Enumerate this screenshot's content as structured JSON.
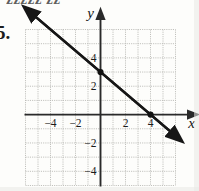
{
  "figure": {
    "problem_number": "5.",
    "top_cut_text": "zzzzz zz",
    "axis_label_x": "x",
    "axis_label_y": "y"
  },
  "chart_data": {
    "type": "line",
    "title": "",
    "xlabel": "x",
    "ylabel": "y",
    "grid": true,
    "legend": null,
    "xlim": [
      -6,
      6
    ],
    "ylim": [
      -5,
      6
    ],
    "x_ticks": [
      -4,
      -2,
      2,
      4
    ],
    "y_ticks": [
      -4,
      -2,
      2,
      4
    ],
    "x_tick_labels": [
      "−4",
      "−2",
      "2",
      "4"
    ],
    "y_tick_labels": [
      "−4",
      "−2",
      "2",
      "4"
    ],
    "grid_step": 1,
    "series": [
      {
        "name": "line",
        "equation": "y = -3/4 x + 3",
        "slope": -0.75,
        "intercept": 3,
        "x": [
          -5.3,
          5.7
        ],
        "y": [
          6.975,
          -1.275
        ],
        "arrow_start": true,
        "arrow_end": true
      }
    ],
    "points": [
      {
        "label": "y-intercept",
        "x": 0,
        "y": 3
      },
      {
        "label": "x-intercept",
        "x": 4,
        "y": 0
      }
    ],
    "colors": {
      "line": "#161616",
      "axis": "#2a2a2a",
      "grid": "#b9b9b4",
      "point": "#111111",
      "background": "#fdfdfb"
    }
  }
}
